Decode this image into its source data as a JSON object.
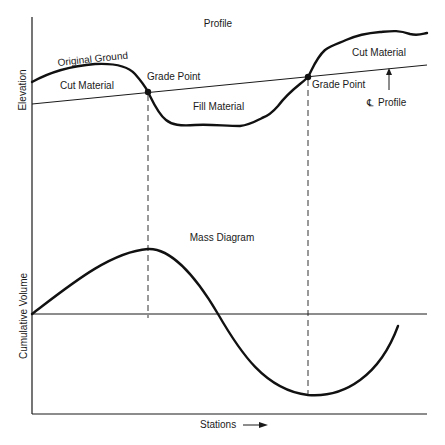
{
  "profile": {
    "title": "Profile",
    "y_axis_label": "Elevation",
    "original_ground_label": "Original Ground",
    "cut_material_left_label": "Cut Material",
    "cut_material_right_label": "Cut Material",
    "fill_material_label": "Fill Material",
    "grade_point_left_label": "Grade Point",
    "grade_point_right_label": "Grade Point",
    "centerline_symbol": "℄",
    "centerline_profile_label": "Profile"
  },
  "mass_diagram": {
    "title": "Mass Diagram",
    "y_axis_label": "Cumulative Volume",
    "x_axis_label": "Stations"
  },
  "colors": {
    "ink": "#1a1a1a",
    "background": "#ffffff"
  }
}
